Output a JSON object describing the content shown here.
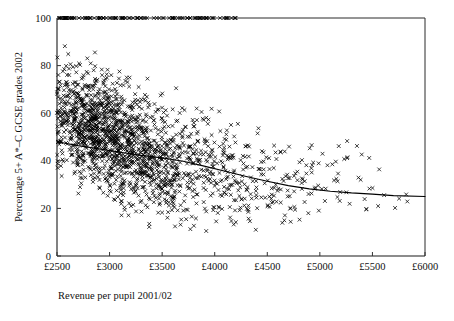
{
  "chart_data": {
    "type": "scatter",
    "title": "",
    "xlabel": "Revenue per pupil 2001/02",
    "ylabel": "Percentage 5+ A*–C GCSE grades 2002",
    "xlim": [
      2500,
      6000
    ],
    "ylim": [
      0,
      100
    ],
    "xticks": [
      2500,
      3000,
      3500,
      4000,
      4500,
      5000,
      5500,
      6000
    ],
    "xtick_labels": [
      "£2500",
      "£3000",
      "£3500",
      "£4000",
      "£4500",
      "£5000",
      "£5500",
      "£6000"
    ],
    "yticks": [
      0,
      20,
      40,
      60,
      80,
      100
    ],
    "ytick_labels": [
      "0",
      "20",
      "40",
      "60",
      "80",
      "100"
    ],
    "grid": false,
    "legend": false,
    "marker": "x",
    "marker_color": "#000000",
    "n_points": 1750,
    "series": [
      {
        "name": "Schools",
        "description": "Each point is one secondary school: revenue per pupil vs percentage of pupils achieving 5+ A*–C GCSE grades",
        "note": "Dense cluster between £2500 and £3600 spanning 10–100%, thinning rightward toward 12–60% with many points capped at 100%"
      }
    ],
    "trend_line": {
      "name": "Fitted curve (negative, concave)",
      "color": "#000000",
      "points": [
        [
          2500,
          48.0
        ],
        [
          2700,
          46.4
        ],
        [
          2900,
          45.0
        ],
        [
          3100,
          43.6
        ],
        [
          3300,
          42.3
        ],
        [
          3500,
          41.2
        ],
        [
          3700,
          39.8
        ],
        [
          3900,
          37.8
        ],
        [
          4100,
          35.6
        ],
        [
          4300,
          33.4
        ],
        [
          4500,
          31.4
        ],
        [
          4700,
          29.6
        ],
        [
          4900,
          28.2
        ],
        [
          5100,
          27.2
        ],
        [
          5300,
          26.5
        ],
        [
          5500,
          26.0
        ],
        [
          5700,
          25.4
        ],
        [
          6000,
          25.0
        ]
      ]
    },
    "density_bands": [
      {
        "x0": 2500,
        "x1": 2650,
        "n": 130,
        "y_mean": 60,
        "y_sd": 19,
        "y_min": 20,
        "y_max": 100
      },
      {
        "x0": 2650,
        "x1": 2800,
        "n": 210,
        "y_mean": 57,
        "y_sd": 20,
        "y_min": 14,
        "y_max": 100
      },
      {
        "x0": 2800,
        "x1": 2950,
        "n": 250,
        "y_mean": 54,
        "y_sd": 20,
        "y_min": 12,
        "y_max": 100
      },
      {
        "x0": 2950,
        "x1": 3100,
        "n": 235,
        "y_mean": 51,
        "y_sd": 20,
        "y_min": 12,
        "y_max": 100
      },
      {
        "x0": 3100,
        "x1": 3250,
        "n": 205,
        "y_mean": 47,
        "y_sd": 20,
        "y_min": 11,
        "y_max": 100
      },
      {
        "x0": 3250,
        "x1": 3400,
        "n": 175,
        "y_mean": 44,
        "y_sd": 20,
        "y_min": 10,
        "y_max": 100
      },
      {
        "x0": 3400,
        "x1": 3550,
        "n": 140,
        "y_mean": 42,
        "y_sd": 20,
        "y_min": 10,
        "y_max": 100
      },
      {
        "x0": 3550,
        "x1": 3700,
        "n": 105,
        "y_mean": 40,
        "y_sd": 20,
        "y_min": 7,
        "y_max": 99
      },
      {
        "x0": 3700,
        "x1": 3850,
        "n": 78,
        "y_mean": 38,
        "y_sd": 19,
        "y_min": 4,
        "y_max": 88
      },
      {
        "x0": 3850,
        "x1": 4000,
        "n": 62,
        "y_mean": 36,
        "y_sd": 18,
        "y_min": 9,
        "y_max": 88
      },
      {
        "x0": 4000,
        "x1": 4150,
        "n": 52,
        "y_mean": 34,
        "y_sd": 18,
        "y_min": 2,
        "y_max": 88
      },
      {
        "x0": 4150,
        "x1": 4300,
        "n": 44,
        "y_mean": 33,
        "y_sd": 18,
        "y_min": 4,
        "y_max": 88
      },
      {
        "x0": 4300,
        "x1": 4450,
        "n": 34,
        "y_mean": 32,
        "y_sd": 16,
        "y_min": 7,
        "y_max": 75
      },
      {
        "x0": 4450,
        "x1": 4600,
        "n": 28,
        "y_mean": 31,
        "y_sd": 15,
        "y_min": 12,
        "y_max": 66
      },
      {
        "x0": 4600,
        "x1": 4750,
        "n": 22,
        "y_mean": 30,
        "y_sd": 15,
        "y_min": 13,
        "y_max": 81
      },
      {
        "x0": 4750,
        "x1": 4900,
        "n": 20,
        "y_mean": 29,
        "y_sd": 14,
        "y_min": 6,
        "y_max": 59
      },
      {
        "x0": 4900,
        "x1": 5050,
        "n": 15,
        "y_mean": 31,
        "y_sd": 14,
        "y_min": 18,
        "y_max": 71
      },
      {
        "x0": 5050,
        "x1": 5200,
        "n": 12,
        "y_mean": 31,
        "y_sd": 13,
        "y_min": 20,
        "y_max": 57
      },
      {
        "x0": 5200,
        "x1": 5400,
        "n": 10,
        "y_mean": 33,
        "y_sd": 12,
        "y_min": 18,
        "y_max": 55
      },
      {
        "x0": 5400,
        "x1": 5600,
        "n": 8,
        "y_mean": 30,
        "y_sd": 13,
        "y_min": 12,
        "y_max": 58
      },
      {
        "x0": 5600,
        "x1": 5850,
        "n": 5,
        "y_mean": 25,
        "y_sd": 5,
        "y_min": 20,
        "y_max": 29
      }
    ],
    "saturated_at_100": {
      "count": 120,
      "x_min": 2520,
      "x_max": 4210,
      "note": "many schools capped at 100%"
    }
  },
  "geometry": {
    "plot_left": 57,
    "plot_right": 425,
    "plot_top": 18,
    "plot_bottom": 256
  }
}
